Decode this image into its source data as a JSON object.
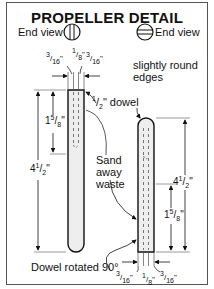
{
  "title": "PROPELLER DETAIL",
  "end_view_left": {
    "label": "End view",
    "icon": "circle-vertical-lines-icon"
  },
  "end_view_right": {
    "label": "End view",
    "icon": "circle-horizontal-lines-icon"
  },
  "left_dowel": {
    "top_dims": {
      "left": "3/16\"",
      "center": "1/8\"",
      "right": "3/16\""
    },
    "label_dowel": "1/2\" dowel",
    "dim_short": "1 5/8\"",
    "dim_long": "4 1/2\""
  },
  "right_dowel": {
    "label_edges_line1": "slightly round",
    "label_edges_line2": "edges",
    "dim_long": "4 1/2\"",
    "dim_short": "1 5/8\"",
    "bottom_dims": {
      "left": "3/16\"",
      "center": "1/8\"",
      "right": "3/16\""
    }
  },
  "sand_label": {
    "line1": "Sand",
    "line2": "away",
    "line3": "waste"
  },
  "rotated_label": "Dowel rotated 90°",
  "colors": {
    "line": "#111111",
    "fill": "#eeeeee",
    "frame": "#555555"
  }
}
